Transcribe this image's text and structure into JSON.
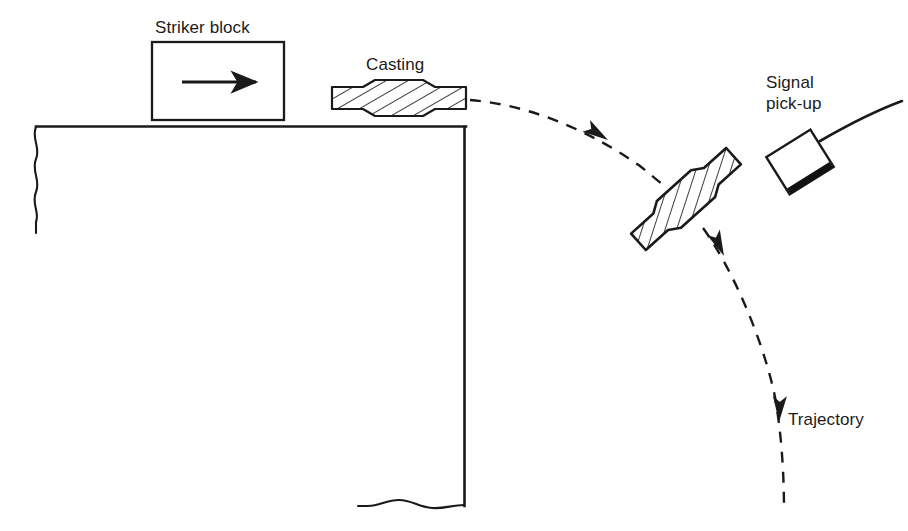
{
  "figure": {
    "background_color": "#ffffff",
    "line_color": "#1a1a1a",
    "caption": ""
  },
  "labels": {
    "striker_block": "Striker block",
    "casting": "Casting",
    "signal_pickup": "Signal\npick-up",
    "trajectory": "Trajectory"
  },
  "elements": {
    "striker_block": {
      "name": "striker-block",
      "shape": "rectangle",
      "x": 151,
      "y": 41,
      "width": 134,
      "height": 80,
      "stroke": "#1a1a1a",
      "stroke_width": 2.2,
      "fill": "#ffffff",
      "inner_arrow": {
        "name": "striker-direction-arrow",
        "direction": "right",
        "x1": 182,
        "y1": 82,
        "x2": 258,
        "y2": 82
      }
    },
    "platform": {
      "name": "table-platform",
      "top_edge": {
        "x1": 36,
        "y1": 126,
        "x2": 466,
        "y2": 126
      },
      "right_edge": {
        "x1": 465,
        "y1": 126,
        "x2": 465,
        "y2": 506
      },
      "left_break_line": {
        "x": 36,
        "y_start": 126,
        "y_end": 232,
        "style": "wavy"
      },
      "bottom_break_line": {
        "x_start": 360,
        "x_end": 465,
        "y": 505,
        "style": "wavy"
      },
      "stroke": "#1a1a1a",
      "stroke_width": 2.4
    },
    "casting_on_table": {
      "name": "casting-on-table",
      "shape": "dumbbell-hatched",
      "cx": 399,
      "cy": 98,
      "length": 134,
      "flange_height": 22,
      "body_height": 34,
      "rotation_deg": 0,
      "hatch_angle_deg": 60,
      "stroke": "#1a1a1a",
      "fill": "#ffffff"
    },
    "casting_in_flight": {
      "name": "casting-in-flight",
      "shape": "dumbbell-hatched",
      "cx": 686,
      "cy": 199,
      "length": 128,
      "flange_height": 22,
      "body_height": 34,
      "rotation_deg": -42,
      "hatch_angle_deg": 60,
      "stroke": "#1a1a1a",
      "fill": "#ffffff"
    },
    "signal_pickup": {
      "name": "signal-pickup-sensor",
      "shape": "rotated-rectangle",
      "cx": 800,
      "cy": 162,
      "width": 52,
      "height": 42,
      "rotation_deg": -32,
      "face_edge_color": "#111111",
      "stroke": "#1a1a1a",
      "fill": "#ffffff",
      "cable": {
        "name": "pickup-cable",
        "from_x": 824,
        "from_y": 140,
        "to_x": 901,
        "to_y": 101
      }
    },
    "trajectory": {
      "name": "trajectory-path",
      "style": "dashed",
      "dash_pattern": "11 9",
      "stroke": "#1a1a1a",
      "stroke_width": 2.4,
      "start": {
        "x": 470,
        "y": 100
      },
      "end": {
        "x": 783,
        "y": 509
      },
      "arrowheads": [
        {
          "name": "trajectory-arrow-upper",
          "x": 604,
          "y": 137,
          "angle_deg": 30
        },
        {
          "name": "trajectory-arrow-middle",
          "x": 722,
          "y": 252,
          "angle_deg": 72
        },
        {
          "name": "trajectory-arrow-lower",
          "x": 779,
          "y": 419,
          "angle_deg": 94
        }
      ]
    }
  }
}
